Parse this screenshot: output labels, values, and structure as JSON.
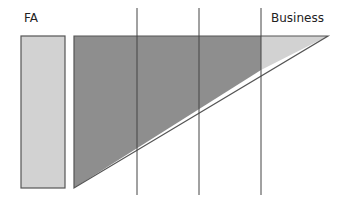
{
  "labels": {
    "left": "FA",
    "right": "Business"
  },
  "colors": {
    "fa_box_fill": "#d2d2d2",
    "dark_region_fill": "#8e8e8e",
    "light_region_fill": "#d2d2d2",
    "stroke": "#555555",
    "divider": "#444444"
  },
  "dividers_x": [
    137,
    199,
    261
  ]
}
